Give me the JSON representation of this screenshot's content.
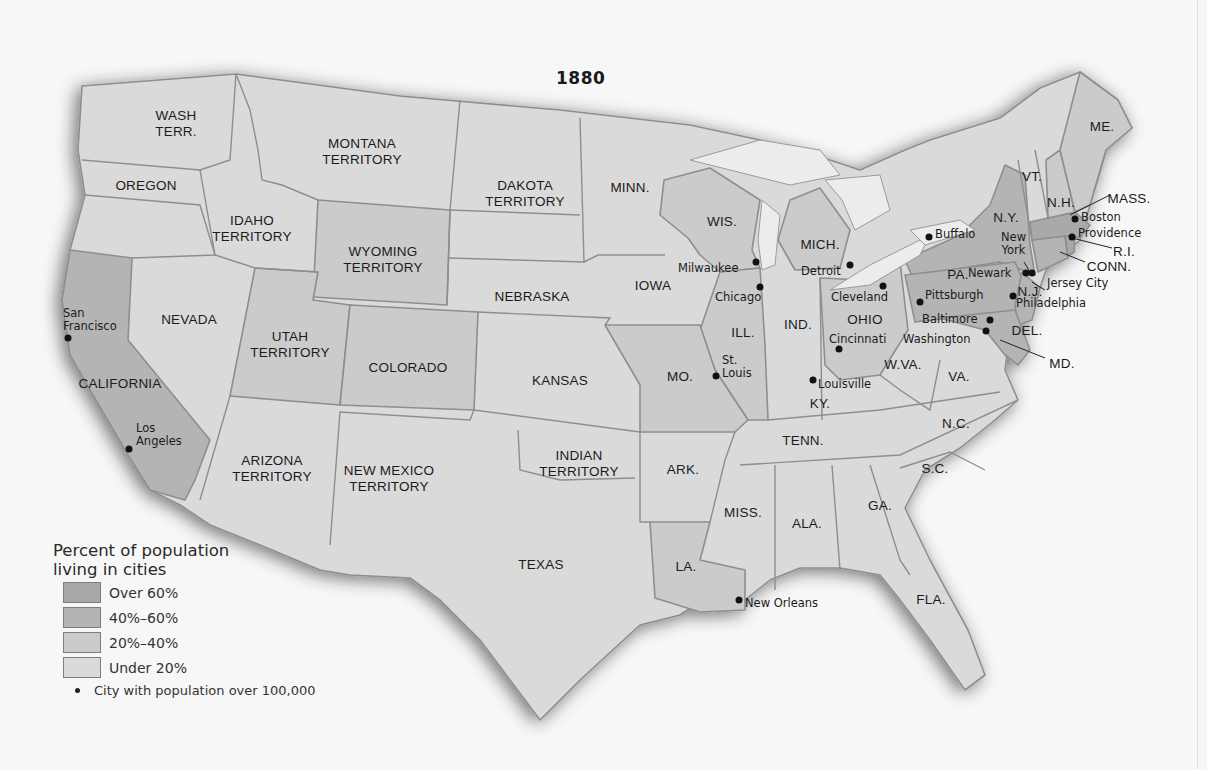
{
  "title": "1880",
  "colors": {
    "over_60": "#a9a9a9",
    "40_60": "#b4b4b4",
    "20_40": "#cbcbcb",
    "under_20": "#dadada",
    "border": "#8e8e8e",
    "water": "#ececec",
    "dot": "#111111"
  },
  "legend": {
    "title_line1": "Percent of population",
    "title_line2": "living in cities",
    "items": [
      {
        "label": "Over 60%",
        "color": "#a9a9a9"
      },
      {
        "label": "40%–60%",
        "color": "#b4b4b4"
      },
      {
        "label": "20%–40%",
        "color": "#cbcbcb"
      },
      {
        "label": "Under 20%",
        "color": "#dadada"
      }
    ],
    "city_symbol_label": "City with population over 100,000"
  },
  "regions": [
    {
      "name": "WASH TERR.",
      "lines": [
        "WASH",
        "TERR."
      ],
      "category": "Under 20%"
    },
    {
      "name": "OREGON",
      "lines": [
        "OREGON"
      ],
      "category": "Under 20%"
    },
    {
      "name": "IDAHO TERRITORY",
      "lines": [
        "IDAHO",
        "TERRITORY"
      ],
      "category": "Under 20%"
    },
    {
      "name": "MONTANA TERRITORY",
      "lines": [
        "MONTANA",
        "TERRITORY"
      ],
      "category": "Under 20%"
    },
    {
      "name": "WYOMING TERRITORY",
      "lines": [
        "WYOMING",
        "TERRITORY"
      ],
      "category": "20%–40%"
    },
    {
      "name": "DAKOTA TERRITORY",
      "lines": [
        "DAKOTA",
        "TERRITORY"
      ],
      "category": "Under 20%"
    },
    {
      "name": "MINN.",
      "lines": [
        "MINN."
      ],
      "category": "Under 20%"
    },
    {
      "name": "WIS.",
      "lines": [
        "WIS."
      ],
      "category": "20%–40%"
    },
    {
      "name": "MICH.",
      "lines": [
        "MICH."
      ],
      "category": "20%–40%"
    },
    {
      "name": "NEVADA",
      "lines": [
        "NEVADA"
      ],
      "category": "Under 20%"
    },
    {
      "name": "CALIFORNIA",
      "lines": [
        "CALIFORNIA"
      ],
      "category": "40%–60%"
    },
    {
      "name": "UTAH TERRITORY",
      "lines": [
        "UTAH",
        "TERRITORY"
      ],
      "category": "20%–40%"
    },
    {
      "name": "COLORADO",
      "lines": [
        "COLORADO"
      ],
      "category": "20%–40%"
    },
    {
      "name": "NEBRASKA",
      "lines": [
        "NEBRASKA"
      ],
      "category": "Under 20%"
    },
    {
      "name": "IOWA",
      "lines": [
        "IOWA"
      ],
      "category": "Under 20%"
    },
    {
      "name": "KANSAS",
      "lines": [
        "KANSAS"
      ],
      "category": "Under 20%"
    },
    {
      "name": "MO.",
      "lines": [
        "MO."
      ],
      "category": "20%–40%"
    },
    {
      "name": "ILL.",
      "lines": [
        "ILL."
      ],
      "category": "20%–40%"
    },
    {
      "name": "IND.",
      "lines": [
        "IND."
      ],
      "category": "Under 20%"
    },
    {
      "name": "OHIO",
      "lines": [
        "OHIO"
      ],
      "category": "20%–40%"
    },
    {
      "name": "ARIZONA TERRITORY",
      "lines": [
        "ARIZONA",
        "TERRITORY"
      ],
      "category": "Under 20%"
    },
    {
      "name": "NEW MEXICO TERRITORY",
      "lines": [
        "NEW MEXICO",
        "TERRITORY"
      ],
      "category": "Under 20%"
    },
    {
      "name": "TEXAS",
      "lines": [
        "TEXAS"
      ],
      "category": "Under 20%"
    },
    {
      "name": "INDIAN TERRITORY",
      "lines": [
        "INDIAN",
        "TERRITORY"
      ],
      "category": "Under 20%"
    },
    {
      "name": "ARK.",
      "lines": [
        "ARK."
      ],
      "category": "Under 20%"
    },
    {
      "name": "LA.",
      "lines": [
        "LA."
      ],
      "category": "20%–40%"
    },
    {
      "name": "MISS.",
      "lines": [
        "MISS."
      ],
      "category": "Under 20%"
    },
    {
      "name": "ALA.",
      "lines": [
        "ALA."
      ],
      "category": "Under 20%"
    },
    {
      "name": "GA.",
      "lines": [
        "GA."
      ],
      "category": "Under 20%"
    },
    {
      "name": "FLA.",
      "lines": [
        "FLA."
      ],
      "category": "Under 20%"
    },
    {
      "name": "TENN.",
      "lines": [
        "TENN."
      ],
      "category": "Under 20%"
    },
    {
      "name": "KY.",
      "lines": [
        "KY."
      ],
      "category": "Under 20%"
    },
    {
      "name": "W.VA.",
      "lines": [
        "W.VA."
      ],
      "category": "Under 20%"
    },
    {
      "name": "VA.",
      "lines": [
        "VA."
      ],
      "category": "Under 20%"
    },
    {
      "name": "N.C.",
      "lines": [
        "N.C."
      ],
      "category": "Under 20%"
    },
    {
      "name": "S.C.",
      "lines": [
        "S.C."
      ],
      "category": "Under 20%"
    },
    {
      "name": "PA.",
      "lines": [
        "PA."
      ],
      "category": "40%–60%"
    },
    {
      "name": "N.Y.",
      "lines": [
        "N.Y."
      ],
      "category": "40%–60%"
    },
    {
      "name": "N.J.",
      "lines": [
        "N.J."
      ],
      "category": "40%–60%"
    },
    {
      "name": "DEL.",
      "lines": [
        "DEL."
      ],
      "category": "40%–60%"
    },
    {
      "name": "MD.",
      "lines": [
        "MD."
      ],
      "category": "40%–60%"
    },
    {
      "name": "VT.",
      "lines": [
        "VT."
      ],
      "category": "Under 20%"
    },
    {
      "name": "N.H.",
      "lines": [
        "N.H."
      ],
      "category": "20%–40%"
    },
    {
      "name": "ME.",
      "lines": [
        "ME."
      ],
      "category": "20%–40%"
    },
    {
      "name": "MASS.",
      "lines": [
        "MASS."
      ],
      "category": "Over 60%"
    },
    {
      "name": "R.I.",
      "lines": [
        "R.I."
      ],
      "category": "Over 60%"
    },
    {
      "name": "CONN.",
      "lines": [
        "CONN."
      ],
      "category": "40%–60%"
    }
  ],
  "cities": [
    {
      "name": "San Francisco",
      "lines": [
        "San",
        "Francisco"
      ]
    },
    {
      "name": "Los Angeles",
      "lines": [
        "Los",
        "Angeles"
      ]
    },
    {
      "name": "Milwaukee"
    },
    {
      "name": "Chicago"
    },
    {
      "name": "Detroit"
    },
    {
      "name": "Cleveland"
    },
    {
      "name": "Cincinnati"
    },
    {
      "name": "St. Louis",
      "lines": [
        "St.",
        "Louis"
      ]
    },
    {
      "name": "Louisville"
    },
    {
      "name": "New Orleans"
    },
    {
      "name": "Buffalo"
    },
    {
      "name": "New York",
      "lines": [
        "New",
        "York"
      ]
    },
    {
      "name": "Newark"
    },
    {
      "name": "Jersey City"
    },
    {
      "name": "Philadelphia"
    },
    {
      "name": "Pittsburgh"
    },
    {
      "name": "Baltimore"
    },
    {
      "name": "Washington"
    },
    {
      "name": "Boston"
    },
    {
      "name": "Providence"
    }
  ]
}
